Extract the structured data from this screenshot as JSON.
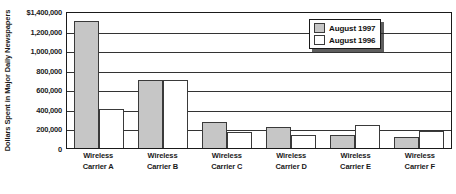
{
  "chart_data": {
    "type": "bar",
    "title": "",
    "xlabel": "",
    "ylabel": "Dollars Spent in Major Daily Newspapers",
    "ylim": [
      0,
      1400000
    ],
    "grid": true,
    "legend_position": "top-right",
    "categories": [
      "Wireless Carrier A",
      "Wireless Carrier B",
      "Wireless Carrier C",
      "Wireless Carrier D",
      "Wireless Carrier E",
      "Wireless Carrier F"
    ],
    "category_lines": [
      {
        "line1": "Wireless",
        "line2": "Carrier A"
      },
      {
        "line1": "Wireless",
        "line2": "Carrier B"
      },
      {
        "line1": "Wireless",
        "line2": "Carrier C"
      },
      {
        "line1": "Wireless",
        "line2": "Carrier D"
      },
      {
        "line1": "Wireless",
        "line2": "Carrier E"
      },
      {
        "line1": "Wireless",
        "line2": "Carrier F"
      }
    ],
    "series": [
      {
        "name": "August 1997",
        "color": "#c6c6c6",
        "values": [
          1300000,
          690000,
          270000,
          215000,
          130000,
          110000
        ]
      },
      {
        "name": "August 1996",
        "color": "#ffffff",
        "values": [
          400000,
          700000,
          160000,
          130000,
          240000,
          170000
        ]
      }
    ],
    "yticks": [
      {
        "value": 1400000,
        "label": "$1,400,000"
      },
      {
        "value": 1200000,
        "label": "1,200,000"
      },
      {
        "value": 1000000,
        "label": "1,000,000"
      },
      {
        "value": 800000,
        "label": "800,000"
      },
      {
        "value": 600000,
        "label": "600,000"
      },
      {
        "value": 400000,
        "label": "400,000"
      },
      {
        "value": 200000,
        "label": "200,000"
      },
      {
        "value": 0,
        "label": "0"
      }
    ]
  },
  "legend": {
    "items": [
      {
        "label": "August 1997"
      },
      {
        "label": "August 1996"
      }
    ]
  },
  "colors": {
    "series_1997": "#c6c6c6",
    "series_1996": "#ffffff",
    "axis": "#1a1a1a",
    "gridline": "#333333",
    "background": "#ffffff"
  }
}
